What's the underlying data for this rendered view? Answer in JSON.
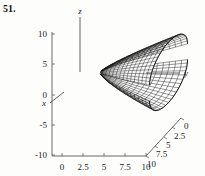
{
  "figure": {
    "problem_number": "51.",
    "caption": ""
  },
  "axes": {
    "vertical": {
      "letter": "z",
      "tick_labels": [
        "10",
        "5",
        "0",
        "-5",
        "-10"
      ],
      "tick_values": [
        10,
        5,
        0,
        -5,
        -10
      ],
      "range": [
        -10,
        10
      ]
    },
    "horizontal": {
      "letter": "x",
      "tick_labels": [
        "0",
        "2.5",
        "5",
        "7.5",
        "10"
      ],
      "tick_values": [
        0,
        2.5,
        5,
        7.5,
        10
      ],
      "range": [
        0,
        10
      ]
    },
    "depth": {
      "letter": "y",
      "tick_labels": [
        "0",
        "2.5",
        "5",
        "7.5",
        "10"
      ],
      "tick_values": [
        0,
        2.5,
        5,
        7.5,
        10
      ],
      "range": [
        0,
        10
      ]
    }
  },
  "chart_data": {
    "type": "surface-wireframe",
    "title": "",
    "xlabel": "x",
    "ylabel": "y",
    "zlabel": "z",
    "xlim": [
      0,
      10
    ],
    "ylim": [
      0,
      10
    ],
    "zlim": [
      -10,
      10
    ],
    "grid": false,
    "legend": "none",
    "surfaces": [
      {
        "name": "upper-sheet",
        "sign": "+",
        "z_extent": [
          0.5,
          11.0
        ]
      },
      {
        "name": "lower-sheet",
        "sign": "-",
        "z_extent": [
          -9.5,
          0.5
        ]
      }
    ],
    "mesh": {
      "u_lines": 22,
      "v_lines": 14,
      "line_color": "#161616"
    }
  },
  "colors": {
    "background": "#fdfdfc",
    "ink": "#161616",
    "axis": "#5a5a5a",
    "label": "#1a1a1a"
  }
}
